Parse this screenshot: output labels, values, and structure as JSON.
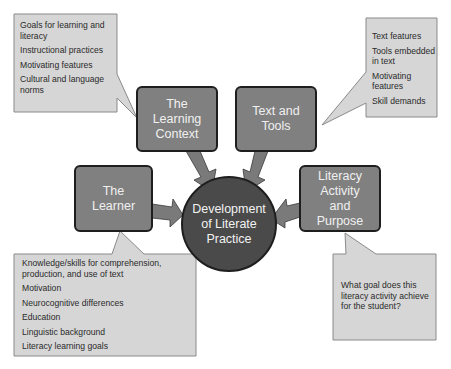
{
  "diagram": {
    "center": {
      "label": "Development of Literate Practice"
    },
    "nodes": [
      {
        "id": "learning-context",
        "label": "The Learning Context"
      },
      {
        "id": "text-and-tools",
        "label": "Text and Tools"
      },
      {
        "id": "learner",
        "label": "The Learner"
      },
      {
        "id": "literacy-activity",
        "label": "Literacy Activity and Purpose"
      }
    ],
    "callouts": {
      "learning_context": {
        "items": [
          "Goals for learning and literacy",
          "Instructional practices",
          "Motivating features",
          "Cultural and language norms"
        ]
      },
      "text_and_tools": {
        "items": [
          "Text features",
          "Tools embedded in text",
          "Motivating features",
          "Skill demands"
        ]
      },
      "learner": {
        "items": [
          "Knowledge/skills for comprehension, production, and use of text",
          "Motivation",
          "Neurocognitive differences",
          "Education",
          "Linguistic background",
          "Literacy learning goals"
        ]
      },
      "literacy_activity": {
        "items": [
          "What goal does this literacy activity achieve for the student?"
        ]
      }
    },
    "colors": {
      "box_fill": "#808080",
      "box_border": "#1e1e1e",
      "circle_fill": "#4a4a4a",
      "arrow_fill": "#7a7a7a",
      "callout_fill": "#d6d6d6",
      "callout_border": "#8a8a8a"
    }
  }
}
